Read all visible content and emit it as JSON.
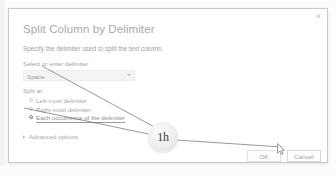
{
  "dialog": {
    "title": "Split Column by Delimiter",
    "subtitle": "Specify the delimiter used to split the text column.",
    "close_icon": "close-icon",
    "delimiter": {
      "label": "Select or enter delimiter",
      "value": "Space",
      "caret_icon": "chevron-down-icon"
    },
    "split_at": {
      "label": "Split at",
      "options": [
        {
          "label": "Left-most delimiter",
          "selected": false
        },
        {
          "label": "Right-most delimiter",
          "selected": false
        },
        {
          "label": "Each occurrence of the delimiter",
          "selected": true
        }
      ]
    },
    "advanced": {
      "label": "Advanced options",
      "caret_icon": "chevron-right-icon",
      "expanded": false
    },
    "buttons": {
      "ok": "OK",
      "cancel": "Cancel"
    }
  },
  "annotation": {
    "badge_text": "1h",
    "cursor_icon": "mouse-pointer-icon"
  },
  "colors": {
    "dialog_border": "#c9c9c9",
    "text_muted": "#a2a2a2",
    "title": "#a9a9a9",
    "combo_bg": "#f4f4f4",
    "annotation_line": "#6d6d6d"
  }
}
